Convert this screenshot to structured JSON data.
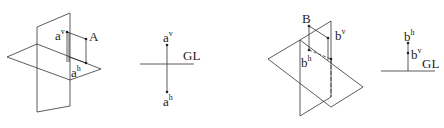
{
  "figures": [
    {
      "id": "fig1-pictorial",
      "point": {
        "label": "A"
      },
      "projections": {
        "vertical": {
          "base": "a",
          "sup": "v"
        },
        "horizontal": {
          "base": "a",
          "sup": "h"
        }
      }
    },
    {
      "id": "fig2-orthographic",
      "ground_line": "GL",
      "projections": {
        "vertical": {
          "base": "a",
          "sup": "v"
        },
        "horizontal": {
          "base": "a",
          "sup": "h"
        }
      }
    },
    {
      "id": "fig3-pictorial",
      "point": {
        "label": "B"
      },
      "projections": {
        "vertical": {
          "base": "b",
          "sup": "v"
        },
        "horizontal": {
          "base": "b",
          "sup": "h"
        }
      }
    },
    {
      "id": "fig4-orthographic",
      "ground_line": "GL",
      "projections": {
        "horizontal": {
          "base": "b",
          "sup": "h"
        },
        "vertical": {
          "base": "b",
          "sup": "v"
        }
      }
    }
  ],
  "colors": {
    "line": "#333333",
    "background": "#ffffff"
  }
}
